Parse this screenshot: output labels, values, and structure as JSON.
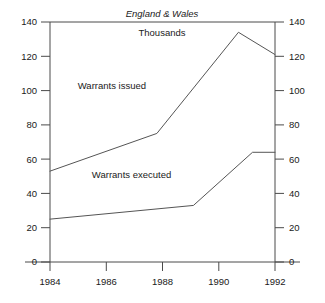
{
  "chart_data": {
    "type": "line",
    "title": "England & Wales",
    "subtitle": "Thousands",
    "xlabel": "",
    "ylabel": "",
    "xlim": [
      1984,
      1992
    ],
    "ylim": [
      0,
      140
    ],
    "y_ticks": [
      0,
      20,
      40,
      60,
      80,
      100,
      120,
      140
    ],
    "x_ticks": [
      1984,
      1986,
      1988,
      1990,
      1992
    ],
    "grid": false,
    "legend_position": "inline-annotation",
    "dual_y_axis": true,
    "series": [
      {
        "name": "Warrants issued",
        "label_x": 1986.2,
        "label_y": 101,
        "x": [
          1984,
          1987.8,
          1990.7,
          1992
        ],
        "values": [
          53,
          75,
          134,
          121
        ]
      },
      {
        "name": "Warrants executed",
        "label_x": 1986.9,
        "label_y": 49,
        "x": [
          1984,
          1989.1,
          1991.2,
          1992
        ],
        "values": [
          25,
          33,
          64,
          64
        ]
      }
    ]
  },
  "axes": {
    "left_tick_labels": [
      "140",
      "120",
      "100",
      "80",
      "60",
      "40",
      "20",
      "0"
    ],
    "right_tick_labels": [
      "140",
      "120",
      "100",
      "80",
      "60",
      "40",
      "20",
      "0"
    ],
    "x_tick_labels": [
      "1984",
      "1986",
      "1988",
      "1990",
      "1992"
    ]
  },
  "colors": {
    "axis": "#4a4a4a",
    "line": "#555555",
    "text": "#1a1a1a",
    "background": "#ffffff"
  }
}
